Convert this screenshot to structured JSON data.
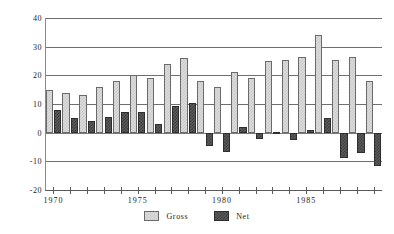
{
  "chart_data": {
    "type": "bar",
    "title": "",
    "subtitle": "",
    "xlabel": "",
    "ylabel": "",
    "ylim": [
      -20,
      40
    ],
    "yticks": [
      40,
      30,
      20,
      10,
      0,
      -10,
      -20
    ],
    "ytick_labels": [
      "40",
      "30",
      "20",
      "10",
      "0",
      "-10",
      "-20"
    ],
    "grid": true,
    "legend_position": "bottom-center",
    "categories": [
      "1970",
      "1971",
      "1972",
      "1973",
      "1974",
      "1975",
      "1976",
      "1977",
      "1978",
      "1979",
      "1980",
      "1981",
      "1982",
      "1983",
      "1984",
      "1985",
      "1986",
      "1987",
      "1988",
      "1989"
    ],
    "xtick_labels": [
      "1970",
      "1975",
      "1980",
      "1985"
    ],
    "xtick_label_categories": [
      "1970",
      "1975",
      "1980",
      "1985"
    ],
    "series": [
      {
        "name": "Gross",
        "color": "#dcdcdc",
        "values": [
          15,
          14,
          13,
          16,
          18,
          20,
          19,
          24,
          26,
          18,
          16,
          21,
          19,
          25,
          25.5,
          26.5,
          34,
          25.5,
          26.5,
          18
        ]
      },
      {
        "name": "Net",
        "color": "#5c5c5c",
        "values": [
          8,
          5.2,
          4.1,
          5.6,
          7.1,
          7.1,
          3.1,
          9.3,
          10.4,
          -4.8,
          -6.8,
          2.1,
          -2.1,
          0.2,
          -2.6,
          0.9,
          5.2,
          -9,
          -7.2,
          -11.7
        ]
      }
    ]
  },
  "legend": {
    "items": [
      {
        "label": "Gross",
        "swatch": "gross"
      },
      {
        "label": "Net",
        "swatch": "net"
      }
    ]
  }
}
